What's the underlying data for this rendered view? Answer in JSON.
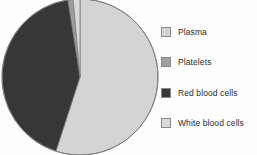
{
  "chart_data": {
    "type": "pie",
    "title": "",
    "subtitle": "",
    "xlabel": "",
    "ylabel": "",
    "grid": false,
    "legend_position": "right",
    "start_angle_deg": 0,
    "direction": "clockwise",
    "categories": [
      "Plasma",
      "Platelets",
      "Red blood cells",
      "White blood cells"
    ],
    "values": [
      55,
      1,
      43,
      1
    ],
    "units": "percent",
    "slices": [
      {
        "label": "Plasma",
        "value": 55,
        "color": "#d4d4d4",
        "start_angle_deg": 0,
        "end_angle_deg": 198
      },
      {
        "label": "Platelets",
        "value": 1,
        "color": "#9e9e9e",
        "start_angle_deg": 351,
        "end_angle_deg": 355
      },
      {
        "label": "Red blood cells",
        "value": 43,
        "color": "#373737",
        "start_angle_deg": 198,
        "end_angle_deg": 351
      },
      {
        "label": "White blood cells",
        "value": 1,
        "color": "#d9d9d9",
        "start_angle_deg": 355,
        "end_angle_deg": 360
      }
    ],
    "outline_color": "#7d7d7d"
  },
  "legend": {
    "items": [
      {
        "label": "Plasma",
        "swatch_color": "#d4d4d4",
        "icon": "legend-swatch-icon"
      },
      {
        "label": "Platelets",
        "swatch_color": "#9e9e9e",
        "icon": "legend-swatch-icon"
      },
      {
        "label": "Red blood cells",
        "swatch_color": "#373737",
        "icon": "legend-swatch-icon"
      },
      {
        "label": "White blood cells",
        "swatch_color": "#d9d9d9",
        "icon": "legend-swatch-icon"
      }
    ]
  }
}
